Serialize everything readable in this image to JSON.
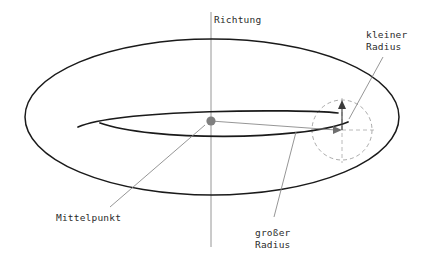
{
  "figure": {
    "type": "torus-wireframe-diagram",
    "title_label": "Richtung",
    "language": "de",
    "background_color": "#ffffff",
    "stroke_color": "#1a1a1a",
    "thin_line_color": "#808080",
    "dash_color": "#9a9a9a",
    "center_dot_color": "#808080"
  },
  "labels": {
    "direction": "Richtung",
    "minor_radius_line1": "kleiner",
    "minor_radius_line2": "Radius",
    "center_point": "Mittelpunkt",
    "major_radius_line1": "großer",
    "major_radius_line2": "Radius"
  },
  "geometry": {
    "axis": {
      "x": 211,
      "y_top": 12,
      "y_bottom": 247
    },
    "outer_ellipse": {
      "cx": 212,
      "cy": 117,
      "rx": 187,
      "ry": 78
    },
    "inner_hole_ellipse": {
      "cx": 212,
      "cy": 122,
      "rx": 107,
      "ry": 16
    },
    "center_point": {
      "x": 211,
      "y": 121,
      "r": 4.5
    },
    "tube_circle": {
      "cx": 342,
      "cy": 130,
      "r": 30
    },
    "major_radius_arrow": {
      "x1": 211,
      "y1": 121,
      "x2": 342,
      "y2": 130
    },
    "minor_radius_arrow": {
      "x1": 342,
      "y1": 130,
      "x2": 342,
      "y2": 102
    }
  },
  "leaders": {
    "center_point": {
      "x1": 205,
      "y1": 124,
      "x2": 110,
      "y2": 207
    },
    "major_radius": {
      "x1": 296,
      "y1": 132,
      "x2": 274,
      "y2": 218
    },
    "minor_radius": {
      "x1": 349,
      "y1": 118,
      "x2": 383,
      "y2": 57
    }
  }
}
